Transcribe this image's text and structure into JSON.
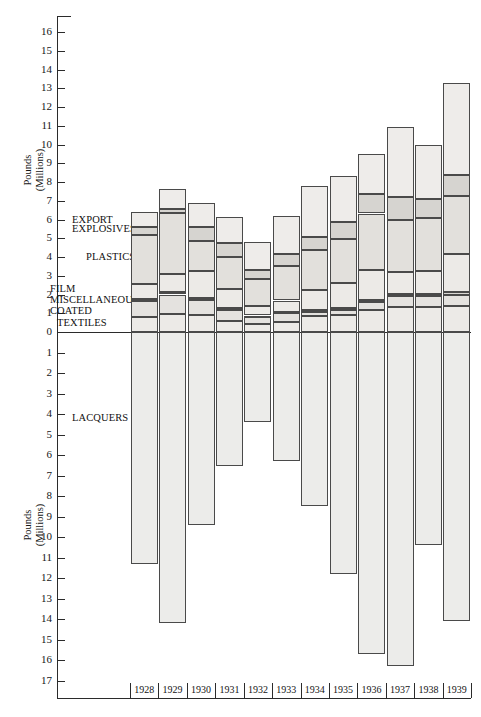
{
  "chart_data": {
    "type": "bar",
    "title": "",
    "subtitle": "",
    "xlabel": "",
    "ylabel": "Pounds (Millions)",
    "ylabel_line1": "Pounds",
    "ylabel_line2": "(Millions)",
    "orientation": "vertical-stacked-diverging",
    "grid": false,
    "legend_position": "inline-left",
    "categories": [
      "1928",
      "1929",
      "1930",
      "1931",
      "1932",
      "1933",
      "1934",
      "1935",
      "1936",
      "1937",
      "1938",
      "1939"
    ],
    "axis_up_ticks": [
      "16",
      "15",
      "14",
      "13",
      "12",
      "11",
      "10",
      "9",
      "8",
      "7",
      "6",
      "5",
      "4",
      "3",
      "2",
      "1",
      "0"
    ],
    "axis_down_ticks": [
      "1",
      "2",
      "3",
      "4",
      "5",
      "6",
      "7",
      "8",
      "9",
      "10",
      "11",
      "12",
      "13",
      "14",
      "15",
      "16",
      "17"
    ],
    "ylim_up": [
      0,
      16.8
    ],
    "ylim_down": [
      0,
      17.5
    ],
    "note": "Upper half is stacked positive segments; lower half is a single LACQUERS bar plotted downward.",
    "series": [
      {
        "name": "TEXTILES",
        "values": [
          0.8,
          0.95,
          0.9,
          0.6,
          0.45,
          0.55,
          0.85,
          0.9,
          1.15,
          1.35,
          1.35,
          1.4
        ]
      },
      {
        "name": "COATED",
        "values": [
          0.85,
          1.05,
          0.8,
          0.6,
          0.35,
          0.45,
          0.2,
          0.3,
          0.45,
          0.55,
          0.55,
          0.6
        ]
      },
      {
        "name": "MISCELLANEOUS",
        "values": [
          0.12,
          0.15,
          0.12,
          0.1,
          0.08,
          0.08,
          0.1,
          0.1,
          0.12,
          0.12,
          0.12,
          0.12
        ]
      },
      {
        "name": "FILM",
        "values": [
          0.78,
          0.95,
          1.45,
          1.0,
          0.5,
          0.6,
          1.1,
          1.3,
          1.6,
          1.2,
          1.25,
          2.05
        ]
      },
      {
        "name": "PLASTICS",
        "values": [
          2.6,
          3.25,
          1.6,
          1.7,
          1.45,
          1.85,
          2.1,
          2.35,
          3.0,
          2.75,
          2.8,
          3.1
        ]
      },
      {
        "name": "EXPLOSIVES",
        "values": [
          0.45,
          0.2,
          0.75,
          0.75,
          0.5,
          0.65,
          0.7,
          0.9,
          1.05,
          1.25,
          1.0,
          1.1
        ]
      },
      {
        "name": "EXPORT",
        "values": [
          0.8,
          1.1,
          1.25,
          1.4,
          1.45,
          2.0,
          2.75,
          2.45,
          2.15,
          3.7,
          2.9,
          4.9
        ]
      }
    ],
    "totals_up": [
      6.4,
      7.65,
      6.87,
      6.15,
      4.78,
      6.18,
      7.8,
      8.3,
      9.52,
      10.92,
      9.97,
      13.27
    ],
    "lacquers": {
      "name": "LACQUERS",
      "values": [
        11.3,
        14.2,
        9.4,
        6.55,
        4.4,
        6.3,
        8.5,
        11.8,
        15.7,
        16.3,
        10.4,
        14.1
      ]
    },
    "annotations": [
      {
        "text": "EXPORT",
        "at_value": 6.0
      },
      {
        "text": "EXPLOSIVES",
        "at_value": 5.5
      },
      {
        "text": "PLASTICS",
        "at_value": 4.0
      },
      {
        "text": "FILM",
        "at_value": 2.3
      },
      {
        "text": "MISCELLANEOUS",
        "at_value": 1.7
      },
      {
        "text": "COATED",
        "at_value": 1.1
      },
      {
        "text": "TEXTILES",
        "at_value": 0.5
      },
      {
        "text": "LACQUERS",
        "at_value": -4.2
      }
    ]
  }
}
